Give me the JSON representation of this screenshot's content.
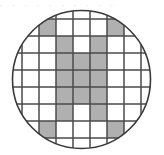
{
  "figure": {
    "title": "",
    "caption": "",
    "artifact_text": "- - - - -   - - -   - -"
  },
  "colors": {
    "background": "#ffffff",
    "cell_empty": "#ffffff",
    "cell_shaded": "#b0b0b0",
    "grid_line": "#4a4a4a",
    "circle_outline": "#3a3a3a",
    "artifact_text": "#c8c8c8"
  },
  "geometry": {
    "width": 164,
    "height": 155,
    "circle_center_x": 81.5,
    "circle_center_y": 79.5,
    "circle_radius": 69,
    "circle_stroke_width": 1.6,
    "grid_origin_x": 22,
    "grid_origin_y": 19,
    "cell_size": 17,
    "grid_cols": 7,
    "grid_rows": 7,
    "grid_stroke_width": 1.5
  },
  "chart_data": {
    "type": "heatmap",
    "title": "",
    "xlabel": "",
    "ylabel": "",
    "grid": true,
    "legend": "none",
    "columns": 7,
    "rows": 7,
    "col_labels": [
      "1",
      "2",
      "3",
      "4",
      "5",
      "6",
      "7"
    ],
    "row_labels": [
      "1",
      "2",
      "3",
      "4",
      "5",
      "6",
      "7"
    ],
    "value_legend": {
      "0": "unshaded",
      "1": "shaded"
    },
    "cells": [
      [
        0,
        1,
        0,
        0,
        0,
        1,
        0
      ],
      [
        0,
        0,
        1,
        0,
        1,
        0,
        0
      ],
      [
        0,
        0,
        1,
        1,
        1,
        0,
        0
      ],
      [
        0,
        0,
        1,
        1,
        1,
        0,
        0
      ],
      [
        0,
        0,
        1,
        1,
        1,
        0,
        0
      ],
      [
        0,
        0,
        1,
        0,
        1,
        0,
        0
      ],
      [
        0,
        1,
        0,
        0,
        0,
        1,
        0
      ]
    ],
    "shaded_count": 17,
    "total_count": 49
  }
}
